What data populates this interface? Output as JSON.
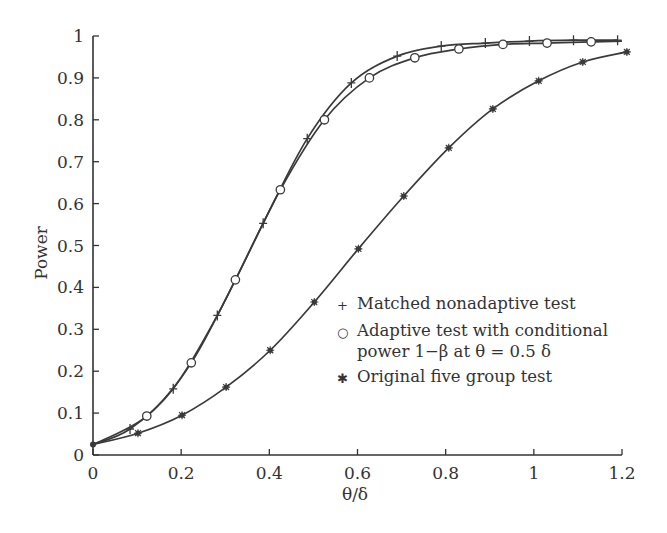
{
  "chart_data": {
    "type": "line",
    "title": "",
    "xlabel": "θ/δ",
    "ylabel": "Power",
    "xlim": [
      0,
      1.2
    ],
    "ylim": [
      0,
      1
    ],
    "xticks": [
      0,
      0.2,
      0.4,
      0.6,
      0.8,
      1,
      1.2
    ],
    "xtick_labels": [
      "0",
      "0.2",
      "0.4",
      "0.6",
      "0.8",
      "1",
      "1.2"
    ],
    "yticks": [
      0,
      0.1,
      0.2,
      0.3,
      0.4,
      0.5,
      0.6,
      0.7,
      0.8,
      0.9,
      1
    ],
    "ytick_labels": [
      "0",
      "0.1",
      "0.2",
      "0.3",
      "0.4",
      "0.5",
      "0.6",
      "0.7",
      "0.8",
      "0.9",
      "1"
    ],
    "grid": false,
    "legend_position": "lower right",
    "series": [
      {
        "name": "Matched nonadaptive test",
        "marker": "+",
        "x": [
          0,
          0.084,
          0.182,
          0.282,
          0.386,
          0.486,
          0.586,
          0.69,
          0.79,
          0.89,
          0.99,
          1.09,
          1.19
        ],
        "y": [
          0.025,
          0.062,
          0.158,
          0.333,
          0.553,
          0.755,
          0.888,
          0.952,
          0.976,
          0.983,
          0.988,
          0.99,
          0.99
        ]
      },
      {
        "name": "Adaptive test with conditional power 1−β at θ = 0.5 δ",
        "marker": "o",
        "x": [
          0,
          0.122,
          0.223,
          0.323,
          0.425,
          0.525,
          0.627,
          0.73,
          0.83,
          0.93,
          1.03,
          1.13,
          1.2
        ],
        "y": [
          0.025,
          0.093,
          0.22,
          0.418,
          0.633,
          0.8,
          0.9,
          0.948,
          0.969,
          0.98,
          0.983,
          0.986,
          0.988
        ],
        "marker_indices": [
          1,
          2,
          3,
          4,
          5,
          6,
          7,
          8,
          9,
          10,
          11
        ]
      },
      {
        "name": "Original five group test",
        "marker": "*",
        "x": [
          0,
          0.102,
          0.202,
          0.302,
          0.402,
          0.502,
          0.602,
          0.705,
          0.807,
          0.907,
          1.011,
          1.111,
          1.211
        ],
        "y": [
          0.025,
          0.052,
          0.095,
          0.162,
          0.25,
          0.365,
          0.492,
          0.618,
          0.733,
          0.826,
          0.893,
          0.938,
          0.962
        ]
      }
    ]
  },
  "legend": {
    "items": [
      {
        "symbol": "+",
        "label": "Matched nonadaptive test"
      },
      {
        "symbol": "○",
        "label": "Adaptive test with conditional\npower 1−β at θ = 0.5 δ"
      },
      {
        "symbol": "✱",
        "label": "Original five group test"
      }
    ]
  },
  "axes": {
    "xlabel": "θ/δ",
    "ylabel": "Power"
  },
  "colors": {
    "line": "#3a3a3a",
    "axis": "#333333",
    "background": "#ffffff"
  }
}
